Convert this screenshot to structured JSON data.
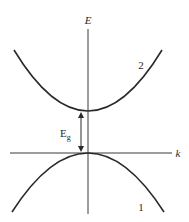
{
  "diagram": {
    "type": "band-structure",
    "axes": {
      "vertical_label": "E",
      "horizontal_label": "k"
    },
    "bands": [
      {
        "label": "2",
        "name": "conduction band",
        "shape": "upward parabola"
      },
      {
        "label": "1",
        "name": "valence band",
        "shape": "downward parabola"
      }
    ],
    "gap": {
      "label_main": "E",
      "label_sub": "g",
      "description": "band gap between band 1 maximum and band 2 minimum"
    },
    "colors": {
      "line": "#2a2a2a",
      "background": "#ffffff"
    }
  }
}
